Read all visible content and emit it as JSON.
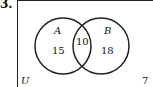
{
  "question_number": "3.",
  "venn": {
    "universe_label": "U",
    "outside_value": "7",
    "set_a": {
      "label": "A",
      "only_value": "15"
    },
    "set_b": {
      "label": "B",
      "only_value": "18"
    },
    "intersection_value": "10"
  },
  "colors": {
    "stroke": "#222222",
    "background": "#ffffff"
  }
}
